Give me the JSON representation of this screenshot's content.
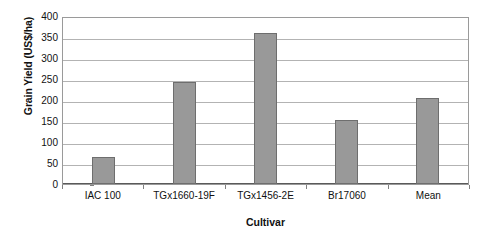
{
  "chart_data": {
    "type": "bar",
    "title": "",
    "categories": [
      "IAC 100",
      "TGx1660-19F",
      "TGx1456-2E",
      "Br17060",
      "Mean"
    ],
    "values": [
      65,
      242,
      360,
      152,
      205
    ],
    "xlabel": "Cultivar",
    "ylabel": "Grain Yield (US$/ha)",
    "ylim": [
      0,
      400
    ],
    "yticks": [
      0,
      50,
      100,
      150,
      200,
      250,
      300,
      350,
      400
    ],
    "ytick_labels": [
      "0",
      "50",
      "100",
      "150",
      "200",
      "250",
      "300",
      "350",
      "400"
    ],
    "grid": true,
    "legend": "none",
    "series": [
      {
        "name": "Grain Yield",
        "values": [
          65,
          242,
          360,
          152,
          205
        ]
      }
    ],
    "colors": {
      "bar_fill": "#999999",
      "bar_border": "#6e6e6e",
      "gridline": "#b3b3b3",
      "axis": "#5a5a5a",
      "plot_border": "#9a9a9a",
      "text": "#111111",
      "background": "#ffffff"
    }
  }
}
